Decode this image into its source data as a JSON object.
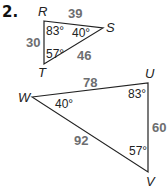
{
  "problem_number": "2.",
  "triangle1": {
    "vertices": {
      "R": "R",
      "S": "S",
      "T": "T"
    },
    "sides": {
      "RS": "39",
      "RT": "30",
      "ST": "46"
    },
    "angles": {
      "R": "83°",
      "S": "40°",
      "T": "57°"
    }
  },
  "triangle2": {
    "vertices": {
      "U": "U",
      "W": "W",
      "V": "V"
    },
    "sides": {
      "WU": "78",
      "UV": "60",
      "WV": "92"
    },
    "angles": {
      "U": "83°",
      "W": "40°",
      "V": "57°"
    }
  },
  "colors": {
    "line": "#222222",
    "side_label": "#6d6e70"
  }
}
